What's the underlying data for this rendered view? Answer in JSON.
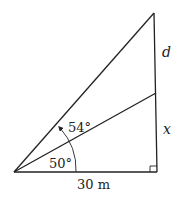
{
  "diagram": {
    "type": "right-triangle-trig-problem",
    "labels": {
      "angle_outer": "54°",
      "angle_inner": "50°",
      "segment_upper": "d",
      "segment_lower": "x",
      "base": "30 m"
    },
    "colors": {
      "line": "#222222",
      "background": "#ffffff"
    },
    "points": {
      "vertex": [
        14,
        172
      ],
      "base_right": [
        157,
        172
      ],
      "top": [
        154,
        13
      ],
      "middle": [
        156,
        93
      ]
    }
  }
}
